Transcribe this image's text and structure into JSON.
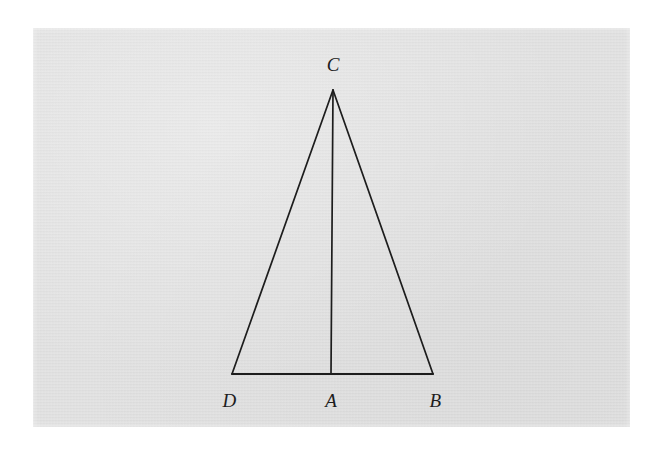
{
  "figure": {
    "kind": "euclidean-geometry-diagram",
    "background_color": "#d7d7d7",
    "page_color": "#ffffff",
    "ink_color": "#1d1d1d",
    "paper": {
      "x": 33,
      "y": 28,
      "width": 597,
      "height": 399
    },
    "points": [
      {
        "id": "C",
        "label": "C",
        "x": 333,
        "y": 90,
        "label_x": 333,
        "label_y": 74,
        "label_anchor": "above"
      },
      {
        "id": "D",
        "label": "D",
        "x": 232,
        "y": 374,
        "label_x": 231,
        "label_y": 391,
        "label_anchor": "below-left"
      },
      {
        "id": "A",
        "label": "A",
        "x": 331,
        "y": 374,
        "label_x": 331,
        "label_y": 391,
        "label_anchor": "below"
      },
      {
        "id": "B",
        "label": "B",
        "x": 433,
        "y": 374,
        "label_x": 434,
        "label_y": 391,
        "label_anchor": "below-right"
      }
    ],
    "segments": [
      {
        "id": "CD",
        "from": "C",
        "to": "D",
        "name": "side-cd",
        "width": 1.7
      },
      {
        "id": "CB",
        "from": "C",
        "to": "B",
        "name": "side-cb",
        "width": 1.7
      },
      {
        "id": "CA",
        "from": "C",
        "to": "A",
        "name": "cevian-ca",
        "width": 1.7
      },
      {
        "id": "DB",
        "from": "D",
        "to": "B",
        "name": "base-db",
        "width": 2.0
      }
    ]
  }
}
